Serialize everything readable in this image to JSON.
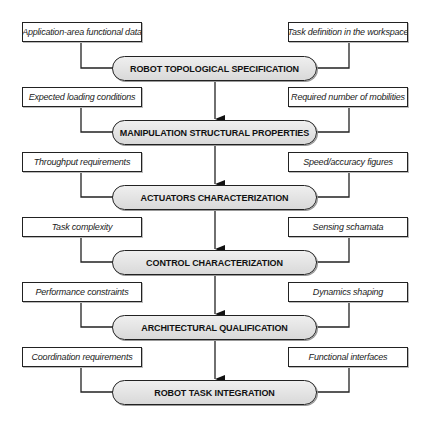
{
  "diagram": {
    "stages": [
      {
        "label": "ROBOT TOPOLOGICAL SPECIFICATION",
        "left_input": "Application-area functional data",
        "right_input": "Task definition in the workspace"
      },
      {
        "label": "MANIPULATION STRUCTURAL PROPERTIES",
        "left_input": "Expected loading conditions",
        "right_input": "Required number of mobilities"
      },
      {
        "label": "ACTUATORS CHARACTERIZATION",
        "left_input": "Throughput requirements",
        "right_input": "Speed/accuracy figures"
      },
      {
        "label": "CONTROL CHARACTERIZATION",
        "left_input": "Task complexity",
        "right_input": "Sensing schamata"
      },
      {
        "label": "ARCHITECTURAL QUALIFICATION",
        "left_input": "Performance constraints",
        "right_input": "Dynamics shaping"
      },
      {
        "label": "ROBOT TASK INTEGRATION",
        "left_input": "Coordination requirements",
        "right_input": "Functional interfaces"
      }
    ],
    "colors": {
      "line": "#222222",
      "pill_fill": "#e2e2e2",
      "box_fill": "#ffffff"
    }
  }
}
